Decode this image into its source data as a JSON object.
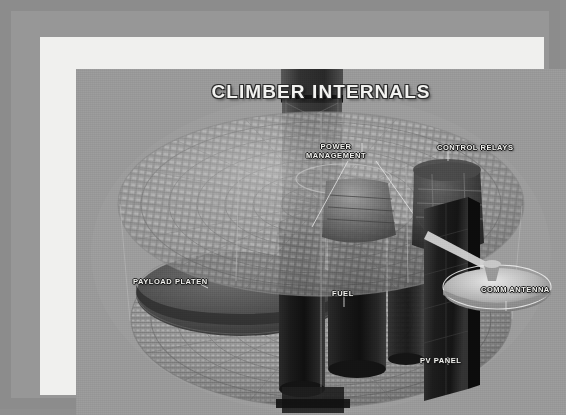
{
  "slide": {
    "title": "CLIMBER INTERNALS",
    "background_color": "#9a9a9a",
    "frame_colors": {
      "outer": "#8c8c8c",
      "mid": "#979797",
      "white_mat": "#f0f0ee"
    },
    "style": "grayscale technical cutaway illustration"
  },
  "labels": {
    "power_management_line1": "POWER",
    "power_management_line2": "MANAGEMENT",
    "control_relays": "CONTROL RELAYS",
    "payload_platen": "PAYLOAD PLATEN",
    "fuel": "FUEL",
    "comm_antenna": "COMM ANTENNA",
    "pv_panel": "PV PANEL"
  },
  "components": [
    {
      "name": "power-management",
      "label": "POWER MANAGEMENT"
    },
    {
      "name": "control-relays",
      "label": "CONTROL RELAYS"
    },
    {
      "name": "payload-platen",
      "label": "PAYLOAD PLATEN"
    },
    {
      "name": "fuel-tanks",
      "label": "FUEL"
    },
    {
      "name": "comm-antenna",
      "label": "COMM ANTENNA"
    },
    {
      "name": "pv-panel",
      "label": "PV PANEL"
    }
  ]
}
